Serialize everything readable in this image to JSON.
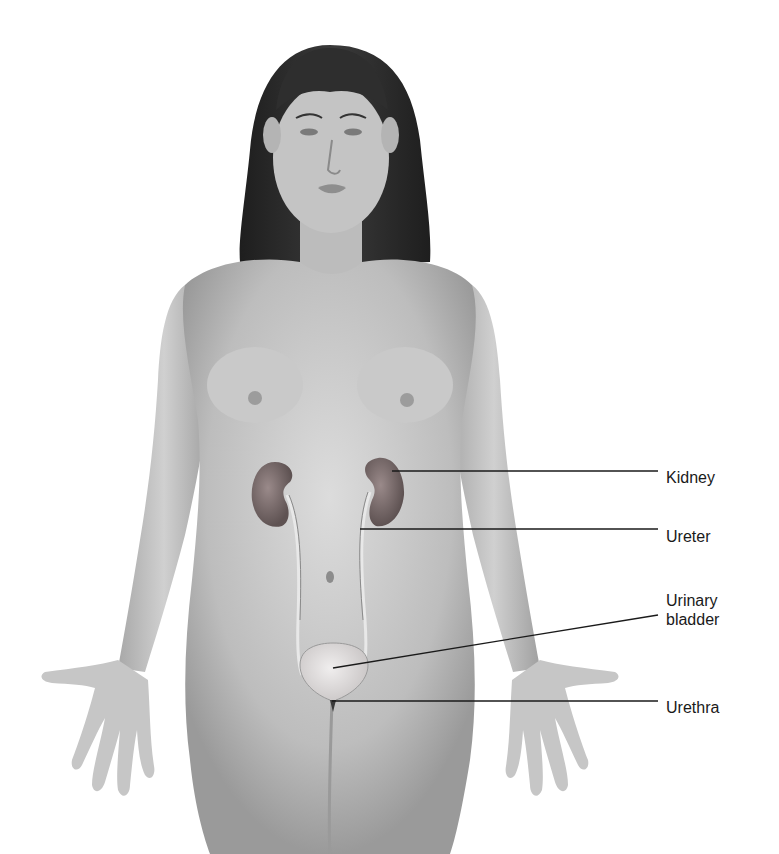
{
  "figure": {
    "labels": [
      {
        "id": "kidney",
        "text": "Kidney",
        "line": {
          "x1": 392,
          "y1": 471,
          "x2": 658,
          "y2": 471
        },
        "text_pos": {
          "x": 666,
          "y": 468
        }
      },
      {
        "id": "ureter",
        "text": "Ureter",
        "line": {
          "x1": 360,
          "y1": 529,
          "x2": 658,
          "y2": 529
        },
        "text_pos": {
          "x": 666,
          "y": 527
        }
      },
      {
        "id": "urinary-bladder",
        "text_line1": "Urinary",
        "text_line2": "bladder",
        "line": {
          "x1": 333,
          "y1": 668,
          "x2": 658,
          "y2": 615
        },
        "text_pos": {
          "x": 666,
          "y": 592
        }
      },
      {
        "id": "urethra",
        "text": "Urethra",
        "line": {
          "x1": 332,
          "y1": 701,
          "x2": 658,
          "y2": 701
        },
        "text_pos": {
          "x": 666,
          "y": 698
        }
      }
    ],
    "colors": {
      "background": "#ffffff",
      "skin_light": "#d9d9d9",
      "skin_mid": "#b5b5b5",
      "skin_dark": "#8e8e8e",
      "hair": "#2a2a2a",
      "kidney": "#7a6a6a",
      "bladder": "#e2dede",
      "leader_line": "#1a1a1a",
      "label_text": "#1a1a1a"
    }
  }
}
